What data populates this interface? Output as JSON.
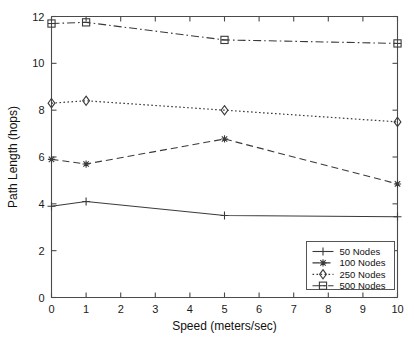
{
  "chart_data": {
    "type": "line",
    "title": "",
    "xlabel": "Speed (meters/sec)",
    "ylabel": "Path Length (hops)",
    "xlim": [
      0,
      10
    ],
    "ylim": [
      0,
      12
    ],
    "xticks": [
      0,
      1,
      2,
      3,
      4,
      5,
      6,
      7,
      8,
      9,
      10
    ],
    "xticklabels": [
      "0",
      "1",
      "2",
      "3",
      "4",
      "5",
      "6",
      "7",
      "8",
      "9",
      "10"
    ],
    "yticks": [
      0,
      2,
      4,
      6,
      8,
      10,
      12
    ],
    "yticklabels": [
      "0",
      "2",
      "4",
      "6",
      "8",
      "10",
      "12"
    ],
    "grid": false,
    "legend_position": "lower right",
    "x": [
      0,
      1,
      5,
      10
    ],
    "series": [
      {
        "name": "50 Nodes",
        "values": [
          3.9,
          4.1,
          3.5,
          3.45
        ],
        "marker": "plus",
        "linestyle": "solid",
        "color": "#3a3a3a"
      },
      {
        "name": "100 Nodes",
        "values": [
          5.9,
          5.7,
          6.77,
          4.85
        ],
        "marker": "star",
        "linestyle": "dashed",
        "color": "#3a3a3a"
      },
      {
        "name": "250 Nodes",
        "values": [
          8.3,
          8.4,
          8.0,
          7.5
        ],
        "marker": "diamond",
        "linestyle": "dotted",
        "color": "#3a3a3a"
      },
      {
        "name": "500 Nodes",
        "values": [
          11.7,
          11.75,
          11.0,
          10.85
        ],
        "marker": "square-dot",
        "linestyle": "dashdot",
        "color": "#3a3a3a"
      }
    ]
  },
  "legend": {
    "entries": [
      {
        "label": "50 Nodes"
      },
      {
        "label": "100 Nodes"
      },
      {
        "label": "250 Nodes"
      },
      {
        "label": "500 Nodes"
      }
    ]
  }
}
